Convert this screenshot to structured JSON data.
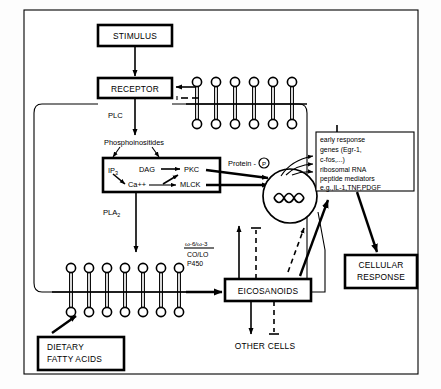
{
  "figure": {
    "border_color": "#000000",
    "background": "#ffffff"
  },
  "boxes": {
    "stimulus": "STIMULUS",
    "receptor": "RECEPTOR",
    "eicosanoids": "EICOSANOIDS",
    "cellular_response_line1": "CELLULAR",
    "cellular_response_line2": "RESPONSE",
    "dietary_line1": "DIETARY",
    "dietary_line2": "FATTY ACIDS",
    "gene_box": {
      "line1": "early response",
      "line2": "genes (Egr-1,",
      "line3": "c-fos,...)",
      "line4": "ribosomal RNA",
      "line5": "peptide mediators",
      "line6": "e.g.,IL-1,TNF,PDGF"
    }
  },
  "second_messenger_box": {
    "ip3": "IP",
    "ip3_sub": "3",
    "dag": "DAG",
    "pkc": "PKC",
    "calcium": "Ca++",
    "mlck": "MLCK"
  },
  "labels": {
    "plc": "PLC",
    "pla2": "PLA",
    "pla2_sub": "2",
    "phosphoinositides": "Phosphoinositides",
    "protein_p": "Protein -",
    "protein_p_circle": "P",
    "omega_ratio": "ω-6/ω-3",
    "co_lo": "CO/LO",
    "p450": "P450",
    "other_cells": "OTHER CELLS"
  },
  "membranes": {
    "upper_top_count": 6,
    "upper_bottom_count": 6,
    "lower_top_count": 7,
    "lower_bottom_count": 7
  },
  "nucleus": {
    "shape": "circle",
    "contents": "dna-double-helix",
    "outgoing_arrows": 3
  }
}
